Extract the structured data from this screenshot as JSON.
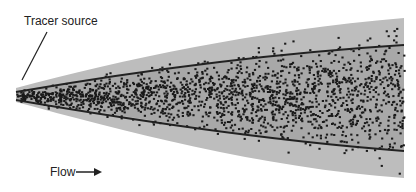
{
  "labels": {
    "source": "Tracer source",
    "flow": "Flow"
  },
  "colors": {
    "plume": "#b8b8b8",
    "core": "#9a9a9a",
    "particles": "#1a1a1a",
    "lines": "#222222"
  }
}
